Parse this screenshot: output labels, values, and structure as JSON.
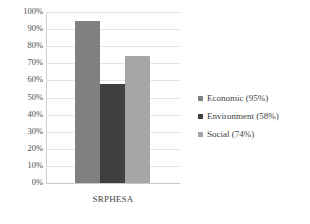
{
  "chart_data": {
    "type": "bar",
    "title": "",
    "subtitle": "",
    "xlabel": "",
    "ylabel": "",
    "categories": [
      "SRPHESA"
    ],
    "series": [
      {
        "name": "Economic (95%)",
        "values": [
          95
        ],
        "color": "#808080"
      },
      {
        "name": "Environment (58%)",
        "values": [
          58
        ],
        "color": "#404040"
      },
      {
        "name": "Social (74%)",
        "values": [
          74
        ],
        "color": "#a6a6a6"
      }
    ],
    "ylim": [
      0,
      100
    ],
    "ytick_step": 10,
    "ytick_labels": [
      "100%",
      "90%",
      "80%",
      "70%",
      "60%",
      "50%",
      "40%",
      "30%",
      "20%",
      "10%",
      "0%"
    ],
    "ytick_values": [
      100,
      90,
      80,
      70,
      60,
      50,
      40,
      30,
      20,
      10,
      0
    ],
    "grid": true,
    "grid_axis": "y",
    "legend_position": "right",
    "value_suffix": "%"
  }
}
